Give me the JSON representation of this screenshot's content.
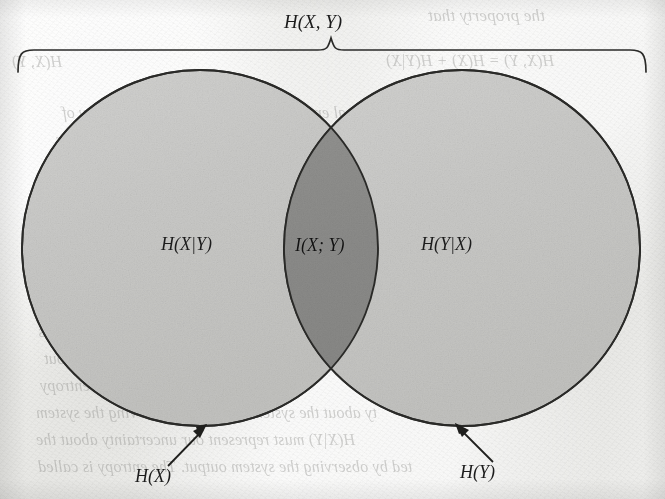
{
  "figure": {
    "type": "venn-diagram",
    "topic": "information-theory-entropy",
    "brace_label": "H(X, Y)",
    "left_region_label": "H(X|Y)",
    "intersection_label": "I(X; Y)",
    "right_region_label": "H(Y|X)",
    "left_circle_callout": "H(X)",
    "right_circle_callout": "H(Y)",
    "colors": {
      "paper": "#e9e9e7",
      "ink": "#1c1c1c",
      "circle_fill": "#c9c9c7",
      "intersection_fill": "#8d8d8b",
      "bleed_text": "#7d7d7a"
    },
    "geometry": {
      "left_circle": {
        "cx": 200,
        "cy": 248,
        "r": 178
      },
      "right_circle": {
        "cx": 462,
        "cy": 248,
        "r": 178
      },
      "brace": {
        "x_start": 18,
        "x_end": 646,
        "y": 50,
        "tip_x": 331,
        "tip_y": 34
      }
    }
  },
  "bleed_through": {
    "lines": [
      {
        "text": "the property that",
        "x": 428,
        "y": 6,
        "size": 17
      },
      {
        "text": "H(X, Y) = H(X) + H(Y|X)",
        "x": 386,
        "y": 52,
        "size": 16
      },
      {
        "text": "conditional entropy H(X|Y) represents the entropy of",
        "x": 62,
        "y": 104,
        "size": 16
      },
      {
        "text": "of the system when X and Y are jointly. Its behaviour",
        "x": 56,
        "y": 131,
        "size": 16
      },
      {
        "text": "H(Y|X) and H(X|Y) denote the entropy of X and Y",
        "x": 58,
        "y": 158,
        "size": 16
      },
      {
        "text": "to logarithmic",
        "x": 487,
        "y": 236,
        "size": 16
      },
      {
        "text": "I(X; Y) is the mutual information then D given",
        "x": 44,
        "y": 296,
        "size": 16
      },
      {
        "text": "X and Y are less useful if the variable is",
        "x": 38,
        "y": 323,
        "size": 16
      },
      {
        "text": "since the entropy H(X, Y) terms are uncertain about",
        "x": 44,
        "y": 350,
        "size": 16
      },
      {
        "text": "is an increase in the system joint entropy",
        "x": 40,
        "y": 377,
        "size": 16
      },
      {
        "text": "ty about the system input after observing the system",
        "x": 36,
        "y": 404,
        "size": 16
      },
      {
        "text": "H(X|Y) must represent our uncertainty about the",
        "x": 36,
        "y": 431,
        "size": 16
      },
      {
        "text": "ted by observing the system output. The entropy is called",
        "x": 38,
        "y": 458,
        "size": 16
      },
      {
        "text": "H(X, Y)",
        "x": 12,
        "y": 53,
        "size": 16
      }
    ]
  }
}
